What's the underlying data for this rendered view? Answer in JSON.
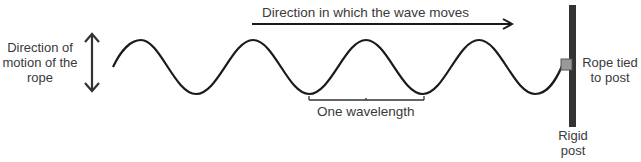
{
  "diagram": {
    "labels": {
      "left": "Direction of motion of the rope",
      "left_lines": [
        "Direction of",
        "motion of the",
        "rope"
      ],
      "top": "Direction in which the wave moves",
      "wavelength": "One wavelength",
      "tied_lines": [
        "Rope tied",
        "to post"
      ],
      "post_lines": [
        "Rigid",
        "post"
      ]
    },
    "colors": {
      "wave": "#1a1a1a",
      "post": "#333333",
      "knot": "#999999",
      "text": "#3a3a3a"
    },
    "wave": {
      "start_x": 113,
      "end_x": 562,
      "mid_y": 67,
      "amplitude": 27,
      "wavelength": 113,
      "cycles": 4
    }
  }
}
